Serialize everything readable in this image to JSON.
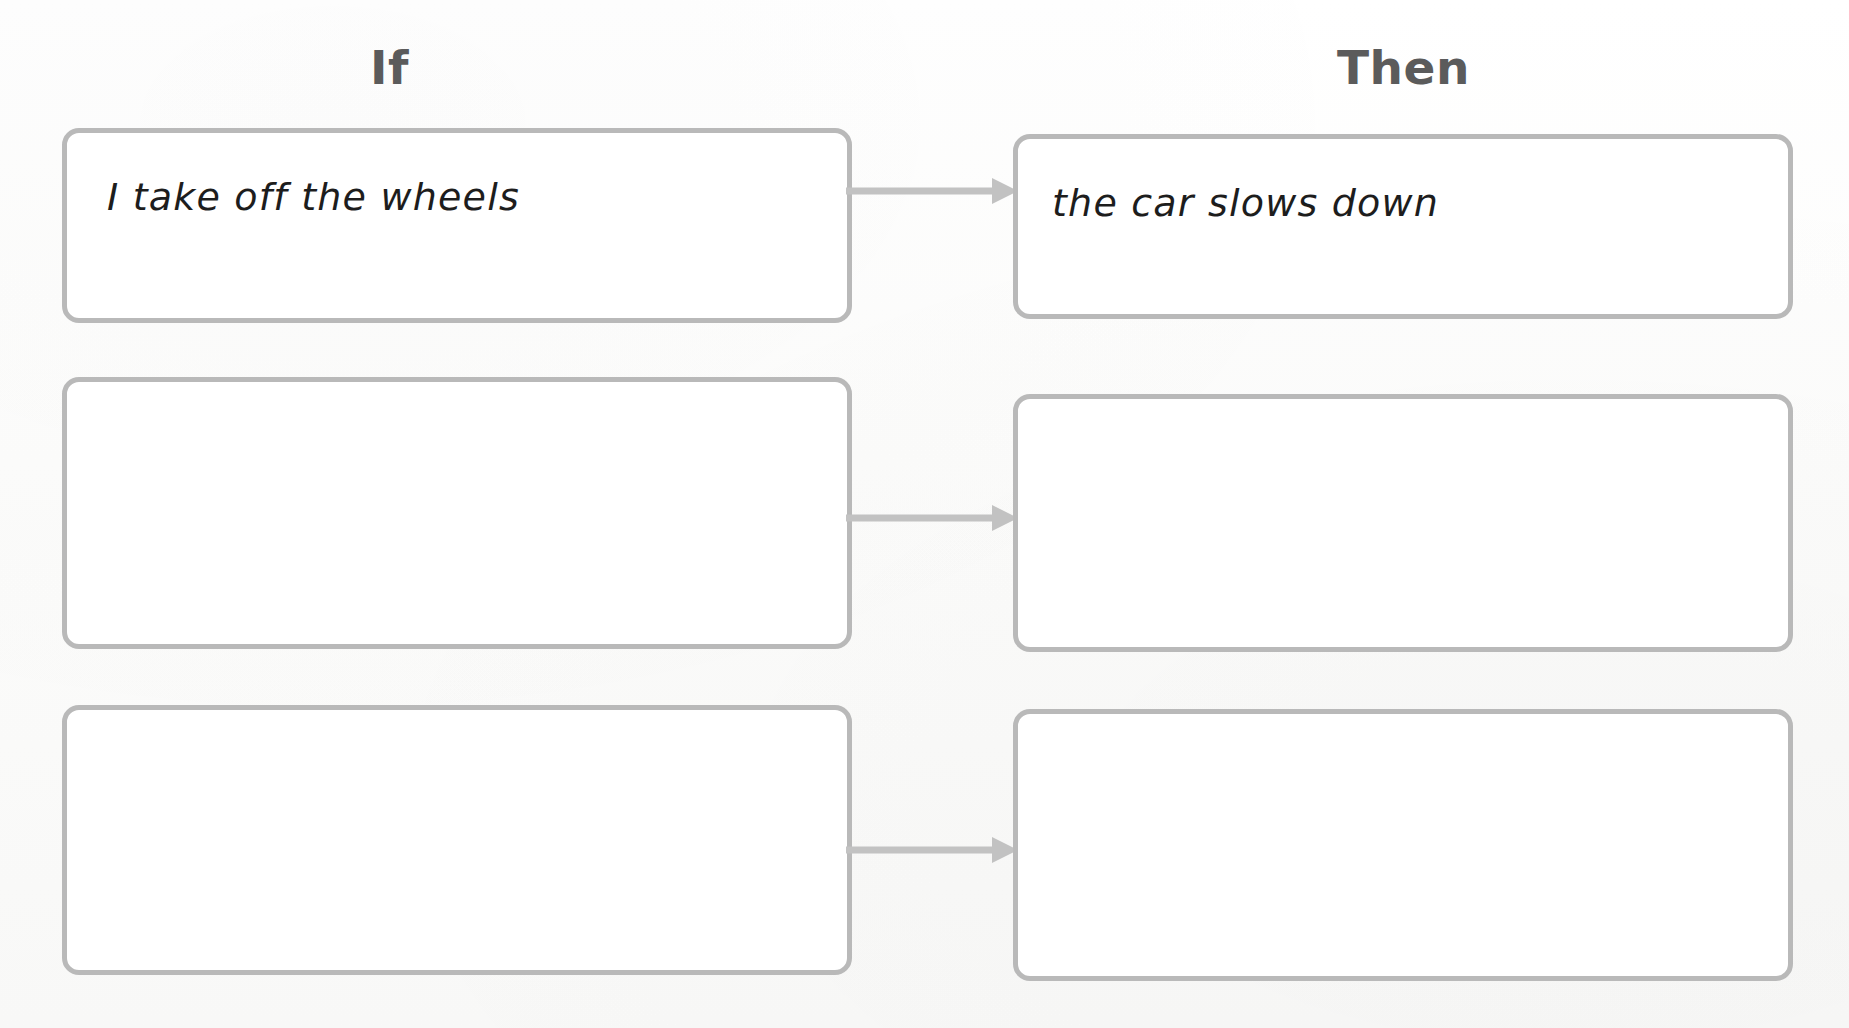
{
  "worksheet": {
    "title_if": "If",
    "title_then": "Then",
    "accent_border_color": "#b9b9b9",
    "heading_color": "#5b5b5b",
    "arrow_color": "#c2c2c2",
    "background_color": "#fdfdfc",
    "rows": [
      {
        "if_text": "I take off the wheels",
        "then_text": "the car slows down",
        "arrow": "arrow-right-icon"
      },
      {
        "if_text": "",
        "then_text": "",
        "arrow": "arrow-right-icon"
      },
      {
        "if_text": "",
        "then_text": "",
        "arrow": "arrow-right-icon"
      }
    ]
  }
}
